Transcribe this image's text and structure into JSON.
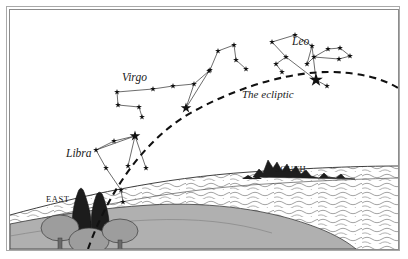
{
  "labels": {
    "virgo": "Virgo",
    "leo": "Leo",
    "libra": "Libra",
    "ecliptic": "The ecliptic",
    "east": "EAST",
    "south": "SOUTH"
  },
  "colors": {
    "ink": "#1a1a1a",
    "star": "#111111",
    "ground": "#a8a8a8",
    "water": "#ffffff",
    "tree_canopy": "#9a9a9a",
    "cypress": "#1e1e1e",
    "mountain": "#1a1a1a",
    "frame": "#8c8c8c",
    "sky": "#ffffff"
  },
  "chart_data": {
    "type": "scatter",
    "xlabel": "",
    "ylabel": "",
    "xlim": [
      0,
      388
    ],
    "ylim": [
      0,
      239
    ],
    "grid": false,
    "legend": "none",
    "annotations": [
      {
        "text": "Virgo",
        "x": 112,
        "y": 62,
        "style": "italic"
      },
      {
        "text": "Leo",
        "x": 282,
        "y": 26,
        "style": "italic"
      },
      {
        "text": "Libra",
        "x": 56,
        "y": 138,
        "style": "italic"
      },
      {
        "text": "The ecliptic",
        "x": 232,
        "y": 79,
        "style": "italic"
      },
      {
        "text": "EAST",
        "x": 36,
        "y": 185,
        "style": "smallcaps"
      },
      {
        "text": "SOUTH",
        "x": 265,
        "y": 155,
        "style": "smallcaps"
      }
    ],
    "ecliptic_path": "M 78,239 C 96,188 132,128 186,100 C 238,72 288,62 318,62 C 348,62 372,68 388,78",
    "horizon_path": "M 0,205 C 70,186 150,168 240,162 C 300,158 350,156 388,156",
    "constellations": [
      {
        "name": "Libra",
        "stars": [
          {
            "id": "l1",
            "x": 104,
            "y": 131,
            "mag": "small"
          },
          {
            "id": "l2",
            "x": 86,
            "y": 140,
            "mag": "small"
          },
          {
            "id": "l3",
            "x": 125,
            "y": 126,
            "mag": "bright"
          },
          {
            "id": "l4",
            "x": 96,
            "y": 158,
            "mag": "small"
          },
          {
            "id": "l5",
            "x": 118,
            "y": 156,
            "mag": "small"
          },
          {
            "id": "l6",
            "x": 136,
            "y": 158,
            "mag": "small"
          },
          {
            "id": "l7",
            "x": 111,
            "y": 180,
            "mag": "small"
          },
          {
            "id": "l8",
            "x": 113,
            "y": 192,
            "mag": "small"
          }
        ],
        "links": [
          [
            "l2",
            "l1"
          ],
          [
            "l1",
            "l3"
          ],
          [
            "l3",
            "l2"
          ],
          [
            "l2",
            "l4"
          ],
          [
            "l3",
            "l5"
          ],
          [
            "l3",
            "l6"
          ],
          [
            "l4",
            "l7"
          ],
          [
            "l7",
            "l8"
          ]
        ]
      },
      {
        "name": "Virgo",
        "stars": [
          {
            "id": "v1",
            "x": 107,
            "y": 82,
            "mag": "small"
          },
          {
            "id": "v2",
            "x": 108,
            "y": 95,
            "mag": "small"
          },
          {
            "id": "v3",
            "x": 129,
            "y": 97,
            "mag": "small"
          },
          {
            "id": "v4",
            "x": 132,
            "y": 107,
            "mag": "small"
          },
          {
            "id": "v5",
            "x": 143,
            "y": 79,
            "mag": "small"
          },
          {
            "id": "v6",
            "x": 163,
            "y": 76,
            "mag": "small"
          },
          {
            "id": "v7",
            "x": 184,
            "y": 74,
            "mag": "small"
          },
          {
            "id": "v8",
            "x": 176,
            "y": 98,
            "mag": "bright"
          },
          {
            "id": "v9",
            "x": 199,
            "y": 61,
            "mag": "small"
          }
        ],
        "links": [
          [
            "v1",
            "v2"
          ],
          [
            "v2",
            "v3"
          ],
          [
            "v3",
            "v4"
          ],
          [
            "v1",
            "v5"
          ],
          [
            "v5",
            "v6"
          ],
          [
            "v6",
            "v7"
          ],
          [
            "v7",
            "v8"
          ],
          [
            "v7",
            "v9"
          ],
          [
            "v8",
            "v9"
          ]
        ]
      },
      {
        "name": "",
        "stars": [
          {
            "id": "u1",
            "x": 200,
            "y": 60,
            "mag": "small"
          },
          {
            "id": "u2",
            "x": 208,
            "y": 41,
            "mag": "small"
          },
          {
            "id": "u3",
            "x": 224,
            "y": 35,
            "mag": "small"
          },
          {
            "id": "u4",
            "x": 226,
            "y": 50,
            "mag": "small"
          },
          {
            "id": "u5",
            "x": 236,
            "y": 59,
            "mag": "small"
          }
        ],
        "links": [
          [
            "u1",
            "u2"
          ],
          [
            "u2",
            "u3"
          ],
          [
            "u3",
            "u4"
          ],
          [
            "u4",
            "u5"
          ]
        ]
      },
      {
        "name": "Leo",
        "stars": [
          {
            "id": "g1",
            "x": 262,
            "y": 32,
            "mag": "small"
          },
          {
            "id": "g2",
            "x": 285,
            "y": 25,
            "mag": "small"
          },
          {
            "id": "g3",
            "x": 302,
            "y": 36,
            "mag": "small"
          },
          {
            "id": "g4",
            "x": 276,
            "y": 47,
            "mag": "small"
          },
          {
            "id": "g5",
            "x": 266,
            "y": 54,
            "mag": "small"
          },
          {
            "id": "g6",
            "x": 272,
            "y": 62,
            "mag": "small"
          },
          {
            "id": "g7",
            "x": 297,
            "y": 54,
            "mag": "small"
          },
          {
            "id": "g8",
            "x": 304,
            "y": 47,
            "mag": "small"
          },
          {
            "id": "g9",
            "x": 318,
            "y": 39,
            "mag": "small"
          },
          {
            "id": "g10",
            "x": 330,
            "y": 38,
            "mag": "small"
          },
          {
            "id": "g11",
            "x": 340,
            "y": 46,
            "mag": "small"
          },
          {
            "id": "g12",
            "x": 329,
            "y": 49,
            "mag": "small"
          },
          {
            "id": "g13",
            "x": 306,
            "y": 70,
            "mag": "brightest"
          },
          {
            "id": "g14",
            "x": 317,
            "y": 76,
            "mag": "small"
          }
        ],
        "links": [
          [
            "g1",
            "g2"
          ],
          [
            "g2",
            "g3"
          ],
          [
            "g1",
            "g4"
          ],
          [
            "g4",
            "g5"
          ],
          [
            "g5",
            "g6"
          ],
          [
            "g3",
            "g7"
          ],
          [
            "g7",
            "g8"
          ],
          [
            "g8",
            "g9"
          ],
          [
            "g9",
            "g10"
          ],
          [
            "g10",
            "g11"
          ],
          [
            "g11",
            "g12"
          ],
          [
            "g12",
            "g8"
          ],
          [
            "g4",
            "g13"
          ],
          [
            "g3",
            "g13"
          ],
          [
            "g13",
            "g14"
          ]
        ]
      }
    ]
  }
}
